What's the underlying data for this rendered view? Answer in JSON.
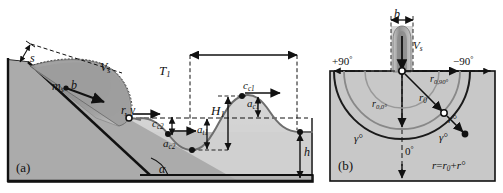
{
  "figure": {
    "type": "schematic-diagram",
    "panels": [
      {
        "tag": "(a)",
        "name": "landslide-wave-profile",
        "description": "Slide mass on an inclined slope generating a wave train in water",
        "labels": {
          "slide_thickness": "s",
          "slide_mass": "m",
          "slide_mass_sub": "s",
          "slide_width": "b",
          "slide_velocity": "V",
          "slide_velocity_sub": "s",
          "slope_angle": "α",
          "impact_distance": "r, γ",
          "wave_period": "T",
          "wave_period_sub": "1",
          "wave_height": "H",
          "wave_height_sub": "1",
          "crest_celerity_1": "c",
          "crest_celerity_1_sub": "c1",
          "crest_celerity_2": "c",
          "crest_celerity_2_sub": "c2",
          "crest_amplitude_1": "a",
          "crest_amplitude_1_sub": "c1",
          "crest_amplitude_2": "a",
          "crest_amplitude_2_sub": "c2",
          "trough_amplitude_1": "a",
          "trough_amplitude_1_sub": "t1",
          "still_water_depth": "h"
        }
      },
      {
        "tag": "(b)",
        "name": "radial-propagation-plan-view",
        "description": "Plan view of radial wave propagation from the slide impact zone",
        "labels": {
          "slide_width": "b",
          "slide_velocity": "V",
          "slide_velocity_sub": "s",
          "angle_plus_90": "+90",
          "angle_minus_90": "−90",
          "angle_zero": "0",
          "degree_symbol": "°",
          "r0_90": "r",
          "r0_90_sub": "0,90°",
          "r0_0": "r",
          "r0_0_sub": "0,0°",
          "r0": "r",
          "r0_sub": "0",
          "r_prime_left": "r°",
          "r_prime_right": "r°",
          "gamma_left": "γ°",
          "gamma_right": "γ°",
          "equation": "r = r₀ + r°",
          "equation_r": "r",
          "equation_eq": "=",
          "equation_r0": "r",
          "equation_r0_sub": "0",
          "equation_plus": "+",
          "equation_rprime": "r°"
        }
      }
    ],
    "colors": {
      "water_fill": "#cfcfcf",
      "ground_fill": "#b4b4b4",
      "slide_fill": "#9a9a9a",
      "outline": "#1a1a1a",
      "curve_gray": "#6e6e6e",
      "panel_border": "#1a1a1a",
      "background": "#ffffff"
    }
  }
}
